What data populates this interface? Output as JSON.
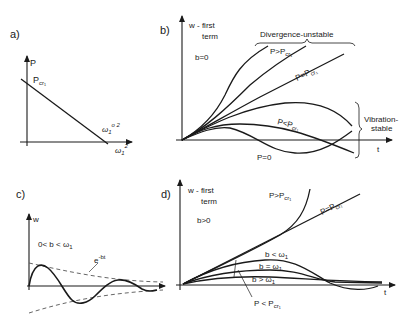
{
  "panels": {
    "a": {
      "label": "a)",
      "y_axis": "P",
      "x_axis": "ω₁²",
      "intercept_y": "Pcr₁",
      "intercept_y_main": "P",
      "intercept_y_sub": "cr₁",
      "intercept_x": "ω₁°²",
      "intercept_x_main": "ω",
      "intercept_x_sub": "1",
      "intercept_x_sup": "o 2",
      "x_axis_main": "ω",
      "x_axis_sub": "1",
      "x_axis_sup": "2"
    },
    "b": {
      "label": "b)",
      "y_axis_line1": "w - first",
      "y_axis_line2": "term",
      "condition": "b=0",
      "x_axis": "t",
      "group_unstable": "Divergence-unstable",
      "group_stable_line1": "Vibration-",
      "group_stable_line2": "stable",
      "curves": {
        "above": "P>Pcr₁",
        "above_main": "P>P",
        "above_sub": "cr₁",
        "equal": "P=Pcr₁",
        "equal_main": "P=P",
        "equal_sub": "cr₁",
        "below": "P<Pcr₁",
        "below_main": "P<P",
        "below_sub": "cr₁",
        "zero": "P=0"
      }
    },
    "c": {
      "label": "c)",
      "y_axis": "w",
      "condition": "0<b<ω₁",
      "condition_main": "0< b < ω",
      "condition_sub": "1",
      "envelope": "e^-bt",
      "envelope_main": "e",
      "envelope_sup": "-bt"
    },
    "d": {
      "label": "d)",
      "y_axis_line1": "w - first",
      "y_axis_line2": "term",
      "condition": "b>0",
      "x_axis": "t",
      "curves": {
        "above": "P>Pcr₁",
        "above_main": "P>P",
        "above_sub": "cr₁",
        "equal": "P=Pcr₁",
        "equal_main": "P=P",
        "equal_sub": "cr₁",
        "b_less": "b<ω₁",
        "b_less_main": "b < ω",
        "b_equal": "b=ω₁",
        "b_equal_main": "b = ω",
        "b_greater": "b>ω₁",
        "b_greater_main": "b > ω",
        "omega_sub": "1",
        "below": "P<Pcr₁",
        "below_main": "P < P",
        "below_sub": "cr₁"
      }
    }
  },
  "colors": {
    "ink": "#1a1a1a",
    "dashed": "#555555",
    "background": "#ffffff"
  }
}
